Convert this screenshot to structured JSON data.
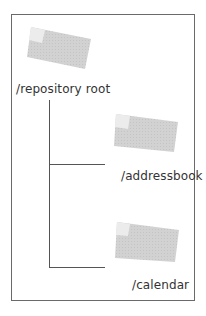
{
  "diagram": {
    "title": "",
    "colors": {
      "border": "#6a6a6a",
      "line": "#555555",
      "folder_fill": "#d2d2d2",
      "folder_tab": "#ececec",
      "text": "#333333"
    },
    "nodes": [
      {
        "id": "root",
        "label": "/repository root",
        "icon": "folder-icon"
      },
      {
        "id": "addressbook",
        "label": "/addressbook",
        "icon": "folder-icon"
      },
      {
        "id": "calendar",
        "label": "/calendar",
        "icon": "folder-icon"
      }
    ],
    "edges": [
      {
        "from": "root",
        "to": "addressbook"
      },
      {
        "from": "root",
        "to": "calendar"
      }
    ]
  }
}
